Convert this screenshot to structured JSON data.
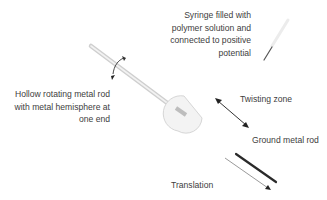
{
  "diagram": {
    "labels": {
      "syringe": [
        "Syringe filled with",
        "polymer solution and",
        "connected to positive",
        "potential"
      ],
      "hollow_rod": [
        "Hollow rotating metal rod",
        "with metal hemisphere at",
        "one end"
      ],
      "twisting_zone": "Twisting zone",
      "ground_rod": "Ground metal rod",
      "translation": "Translation"
    },
    "icons": {
      "rotation": "curved-rotation-arrow-icon",
      "twisting": "double-headed-arrow-icon",
      "translation": "single-arrow-icon"
    },
    "colors": {
      "text": "#404040",
      "hollow_rod": "#d4d4d4",
      "ground_rod": "#2a2a2a",
      "arrow": "#333333"
    }
  }
}
